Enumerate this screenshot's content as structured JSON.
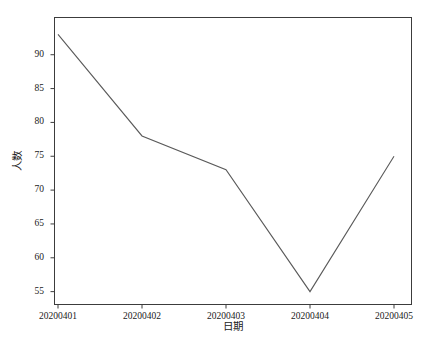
{
  "chart_data": {
    "type": "line",
    "title": "",
    "xlabel": "日期",
    "ylabel": "人数",
    "categories": [
      "20200401",
      "20200402",
      "20200403",
      "20200404",
      "20200405"
    ],
    "values": [
      93,
      78,
      73,
      55,
      75
    ],
    "series": [
      {
        "name": "人数",
        "values": [
          93,
          78,
          73,
          55,
          75
        ]
      }
    ],
    "ylim": [
      53.1,
      95.5
    ],
    "xlim": [
      0,
      4
    ],
    "yticks": [
      55,
      60,
      65,
      70,
      75,
      80,
      85,
      90
    ],
    "ytick_labels": [
      "55",
      "60",
      "65",
      "70",
      "75",
      "80",
      "85",
      "90"
    ],
    "xticks": [
      0,
      1,
      2,
      3,
      4
    ],
    "xtick_labels": [
      "20200401",
      "20200402",
      "20200403",
      "20200404",
      "20200405"
    ],
    "grid": false,
    "legend": false,
    "legend_position": "none",
    "line_color": "#5a5a5a",
    "frame_color": "#3c3c3c",
    "background_color": "#ffffff",
    "markers": false,
    "annotations": []
  }
}
